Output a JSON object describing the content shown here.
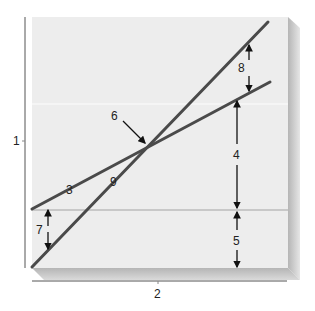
{
  "diagram": {
    "type": "line-graph-schematic",
    "colors": {
      "panel": "#ededed",
      "panel_shadow": "#bdbdbd",
      "line": "#4a4a4a",
      "reference_line": "#c8c8c8",
      "arrow": "#111111",
      "axis": "#555555",
      "text": "#222222"
    },
    "axis_labels": {
      "y": "1",
      "x": "2"
    },
    "callouts": [
      {
        "id": "3",
        "label": "3",
        "target": "shallow line"
      },
      {
        "id": "4",
        "label": "4",
        "target": "distance from reference line to shallow line"
      },
      {
        "id": "5",
        "label": "5",
        "target": "distance from baseline to reference line"
      },
      {
        "id": "6",
        "label": "6",
        "target": "intersection point"
      },
      {
        "id": "7",
        "label": "7",
        "target": "gap between lines at left"
      },
      {
        "id": "8",
        "label": "8",
        "target": "gap between lines at right"
      },
      {
        "id": "9",
        "label": "9",
        "target": "steep line"
      }
    ],
    "lines": [
      {
        "name": "steep",
        "from": [
          32,
          267
        ],
        "to": [
          268,
          22
        ]
      },
      {
        "name": "shallow",
        "from": [
          32,
          209
        ],
        "to": [
          270,
          82
        ]
      }
    ],
    "intersection": [
      147,
      145
    ]
  }
}
